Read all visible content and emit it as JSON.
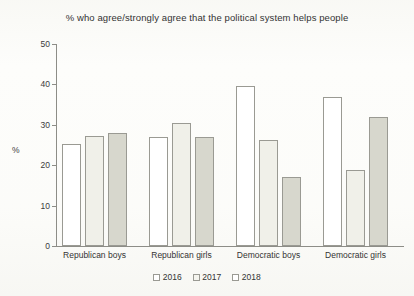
{
  "chart_data": {
    "type": "bar",
    "title": "% who agree/strongly agree that the political system helps people",
    "xlabel": "",
    "ylabel": "%",
    "ylim": [
      0,
      50
    ],
    "yticks": [
      0,
      10,
      20,
      30,
      40,
      50
    ],
    "grid": false,
    "legend_position": "bottom",
    "categories": [
      "Republican boys",
      "Republican girls",
      "Democratic boys",
      "Democratic girls"
    ],
    "series": [
      {
        "name": "2016",
        "values": [
          25.2,
          27.0,
          39.5,
          37.0
        ],
        "fill": "#ffffff"
      },
      {
        "name": "2017",
        "values": [
          27.3,
          30.4,
          26.3,
          18.7
        ],
        "fill": "#f0f0e9"
      },
      {
        "name": "2018",
        "values": [
          28.0,
          27.1,
          17.0,
          32.0
        ],
        "fill": "#d7d7cd"
      }
    ]
  },
  "axis": {
    "y_tick_0": "0",
    "y_tick_10": "10",
    "y_tick_20": "20",
    "y_tick_30": "30",
    "y_tick_40": "40",
    "y_tick_50": "50",
    "y_title": "%"
  },
  "legend": {
    "items": [
      {
        "label": "2016"
      },
      {
        "label": "2017"
      },
      {
        "label": "2018"
      }
    ]
  }
}
